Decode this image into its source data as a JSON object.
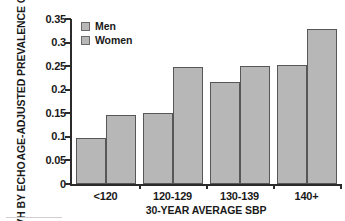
{
  "chart_data": {
    "type": "bar",
    "title": "",
    "subtitle": "",
    "xlabel": "30-YEAR AVERAGE SBP",
    "ylabel": "AGE-ADJUSTED PREVALENCE OF LVH BY ECHO",
    "ylabel_lines": [
      "AGE-ADJUSTED PREVALENCE OF",
      "LVH BY ECHO"
    ],
    "categories": [
      "<120",
      "120-129",
      "130-139",
      "140+"
    ],
    "series": [
      {
        "name": "Men",
        "values": [
          0.097,
          0.15,
          0.217,
          0.252
        ],
        "color": "#b7b7b7"
      },
      {
        "name": "Women",
        "values": [
          0.146,
          0.248,
          0.25,
          0.328
        ],
        "color": "#b7b7b7"
      }
    ],
    "ylim": [
      0,
      0.35
    ],
    "ytick_values": [
      0,
      0.05,
      0.1,
      0.15,
      0.2,
      0.25,
      0.3,
      0.35
    ],
    "ytick_labels": [
      "0",
      "0.05",
      "0.1",
      "0.15",
      "0.2",
      "0.25",
      "0.3",
      "0.35"
    ],
    "grid": false,
    "legend_position": "top-left",
    "legend": [
      "Men",
      "Women"
    ],
    "bar_border_color": "#575757",
    "axis_color": "#2b2b2b",
    "text_color": "#1a1a1a",
    "background_color": "#ffffff"
  }
}
